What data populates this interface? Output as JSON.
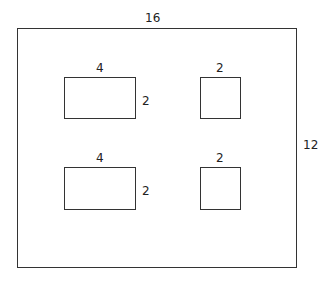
{
  "diagram": {
    "title_clipped": "",
    "outer": {
      "width_label": "16",
      "height_label": "12"
    },
    "rooms": [
      {
        "id": "top-left",
        "width_label": "4",
        "height_label": "2"
      },
      {
        "id": "top-right",
        "width_label": "2"
      },
      {
        "id": "bottom-left",
        "width_label": "4",
        "height_label": "2"
      },
      {
        "id": "bottom-right",
        "width_label": "2"
      }
    ]
  }
}
